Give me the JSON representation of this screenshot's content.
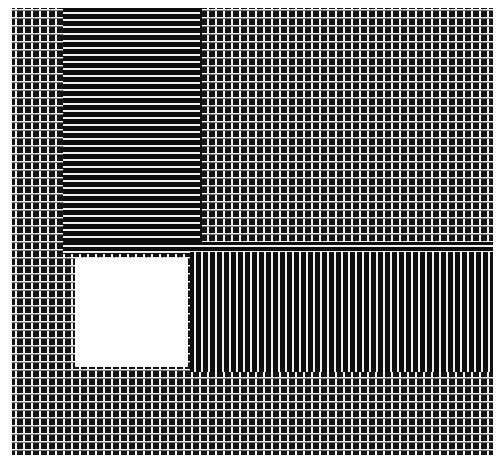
{
  "figure": {
    "regions": [
      {
        "name": "background-weave",
        "pattern": "woven plus/T texture"
      },
      {
        "name": "horizontal-stripes",
        "pattern": "horizontal lines"
      },
      {
        "name": "vertical-stripes",
        "pattern": "vertical lines"
      },
      {
        "name": "blank-square",
        "pattern": "empty"
      }
    ],
    "colors": {
      "ink": "#111111",
      "paper": "#ffffff",
      "thread": "#f2f2f2"
    }
  },
  "caption": {
    "text": ""
  }
}
